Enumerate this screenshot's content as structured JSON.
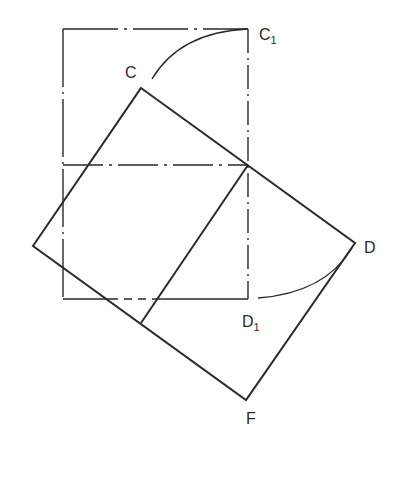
{
  "diagram": {
    "type": "geometric-construction",
    "colors": {
      "stroke": "#2a2a2a",
      "background": "#ffffff"
    },
    "labels": {
      "C": "C",
      "C1_base": "C",
      "C1_sub": "1",
      "D": "D",
      "D1_base": "D",
      "D1_sub": "1",
      "F": "F"
    },
    "points": {
      "rect_top_left": [
        63,
        29
      ],
      "C1": [
        248,
        29
      ],
      "rect_bottom_left": [
        63,
        299
      ],
      "D1": [
        248,
        299
      ],
      "mid_left": [
        63,
        165
      ],
      "mid_right": [
        248,
        165
      ],
      "C": [
        141,
        88
      ],
      "left_vertex": [
        33,
        246
      ],
      "D": [
        355,
        243
      ],
      "F": [
        246,
        400
      ],
      "inner_bottom": [
        141,
        323
      ]
    }
  }
}
